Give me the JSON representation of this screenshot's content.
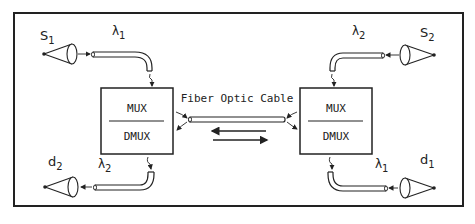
{
  "diagram": {
    "type": "wavelength-division multiplexing link",
    "cable_label": "Fiber Optic Cable",
    "left_terminal": {
      "top_label": "MUX",
      "bottom_label": "DMUX"
    },
    "right_terminal": {
      "top_label": "MUX",
      "bottom_label": "DMUX"
    },
    "sources": [
      {
        "name": "S",
        "sub": "1",
        "wavelength": "λ",
        "wavelength_sub": "1",
        "position": "top-left"
      },
      {
        "name": "S",
        "sub": "2",
        "wavelength": "λ",
        "wavelength_sub": "2",
        "position": "top-right"
      }
    ],
    "detectors": [
      {
        "name": "d",
        "sub": "2",
        "wavelength": "λ",
        "wavelength_sub": "2",
        "position": "bottom-left"
      },
      {
        "name": "d",
        "sub": "1",
        "wavelength": "λ",
        "wavelength_sub": "1",
        "position": "bottom-right"
      }
    ],
    "arrows": [
      "right-to-left",
      "left-to-right"
    ],
    "colors": {
      "line": "#222222",
      "background": "#ffffff"
    }
  }
}
